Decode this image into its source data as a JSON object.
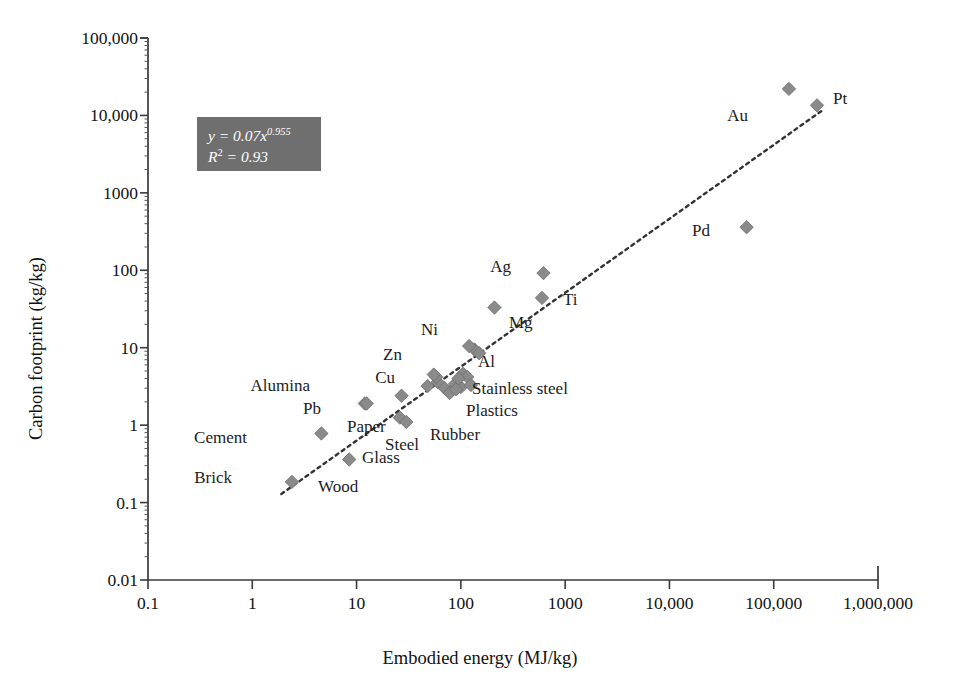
{
  "chart_data": {
    "type": "scatter",
    "title": "",
    "xlabel": "Embodied energy (MJ/kg)",
    "ylabel": "Carbon footprint (kg/kg)",
    "xscale": "log",
    "yscale": "log",
    "xlim": [
      0.1,
      1000000
    ],
    "ylim": [
      0.01,
      100000
    ],
    "grid": false,
    "legend": "none",
    "xticks": [
      "0.1",
      "1",
      "10",
      "100",
      "1000",
      "10,000",
      "100,000",
      "1,000,000"
    ],
    "yticks": [
      "0.01",
      "0.1",
      "1",
      "10",
      "100",
      "1000",
      "10,000",
      "100,000"
    ],
    "annotation": {
      "equation_prefix": "y = 0.07x",
      "equation_exponent": "0.955",
      "r2_prefix": "R",
      "r2_sup": "2",
      "r2_value": " = 0.93",
      "box_color": "#6f6f6f",
      "text_color": "#ffffff"
    },
    "trendline": {
      "type": "power",
      "coefficient": 0.07,
      "exponent": 0.955,
      "r2": 0.93,
      "style": "dotted",
      "x_start": 1.9,
      "x_end": 300000
    },
    "marker_style": {
      "shape": "diamond",
      "color": "#8a8a8a",
      "edge": "#6d6d6d",
      "size": 11
    },
    "points": [
      {
        "label": "Brick",
        "x": 2.4,
        "y": 0.185,
        "lx": 232,
        "ly": 478,
        "anchor": "right"
      },
      {
        "label": "Cement",
        "x": 4.6,
        "y": 0.78,
        "lx": 247,
        "ly": 438,
        "anchor": "right"
      },
      {
        "label": "Wood",
        "x": 8.5,
        "y": 0.36,
        "lx": 318,
        "ly": 487,
        "anchor": "left"
      },
      {
        "label": "Glass",
        "x": 12.0,
        "y": 1.9,
        "lx": 362,
        "ly": 458,
        "anchor": "left"
      },
      {
        "label": "Pb",
        "x": 12.5,
        "y": 1.9,
        "lx": 321,
        "ly": 409,
        "anchor": "right"
      },
      {
        "label": "Paper",
        "x": 26.0,
        "y": 1.25,
        "lx": 347,
        "ly": 427,
        "anchor": "left"
      },
      {
        "label": "Alumina",
        "x": 27.0,
        "y": 2.4,
        "lx": 310,
        "ly": 386,
        "anchor": "right"
      },
      {
        "label": "Steel",
        "x": 30.0,
        "y": 1.1,
        "lx": 385,
        "ly": 445,
        "anchor": "left"
      },
      {
        "label": "Cu",
        "x": 48.0,
        "y": 3.2,
        "lx": 395,
        "ly": 378,
        "anchor": "right"
      },
      {
        "label": "Zn",
        "x": 55.0,
        "y": 4.5,
        "lx": 402,
        "ly": 355,
        "anchor": "right"
      },
      {
        "label": "Rubber",
        "x": 78.0,
        "y": 2.6,
        "lx": 430,
        "ly": 435,
        "anchor": "left"
      },
      {
        "label": "Plastics",
        "x": 90.0,
        "y": 2.9,
        "lx": 466,
        "ly": 411,
        "anchor": "left"
      },
      {
        "label": "Stainless steel",
        "x": 95.0,
        "y": 4.0,
        "lx": 472,
        "ly": 389,
        "anchor": "left"
      },
      {
        "label": "Ni",
        "x": 120.0,
        "y": 10.5,
        "lx": 438,
        "ly": 330,
        "anchor": "right"
      },
      {
        "label": "Al",
        "x": 150.0,
        "y": 8.5,
        "lx": 478,
        "ly": 362,
        "anchor": "left"
      },
      {
        "label": "Mg",
        "x": 210.0,
        "y": 33.0,
        "lx": 509,
        "ly": 323,
        "anchor": "left"
      },
      {
        "label": "Ag",
        "x": 620.0,
        "y": 92.0,
        "lx": 511,
        "ly": 267,
        "anchor": "right"
      },
      {
        "label": "Ti",
        "x": 600.0,
        "y": 44.0,
        "lx": 563,
        "ly": 300,
        "anchor": "left"
      },
      {
        "label": "Pd",
        "x": 55000.0,
        "y": 360.0,
        "lx": 710,
        "ly": 231,
        "anchor": "right"
      },
      {
        "label": "Au",
        "x": 140000.0,
        "y": 22000.0,
        "lx": 748,
        "ly": 116,
        "anchor": "right"
      },
      {
        "label": "Pt",
        "x": 260000.0,
        "y": 13500.0,
        "lx": 833,
        "ly": 99,
        "anchor": "left"
      }
    ],
    "extra_markers": [
      {
        "x": 60.0,
        "y": 3.6
      },
      {
        "x": 70.0,
        "y": 3.0
      },
      {
        "x": 82.0,
        "y": 2.8
      },
      {
        "x": 88.0,
        "y": 3.4
      },
      {
        "x": 100.0,
        "y": 3.1
      },
      {
        "x": 105.0,
        "y": 4.6
      },
      {
        "x": 115.0,
        "y": 4.2
      },
      {
        "x": 125.0,
        "y": 3.3
      },
      {
        "x": 135.0,
        "y": 9.5
      },
      {
        "x": 58.0,
        "y": 4.2
      }
    ]
  },
  "geometry": {
    "plot_left": 148,
    "plot_right": 878,
    "plot_top": 38,
    "plot_bottom": 580
  }
}
